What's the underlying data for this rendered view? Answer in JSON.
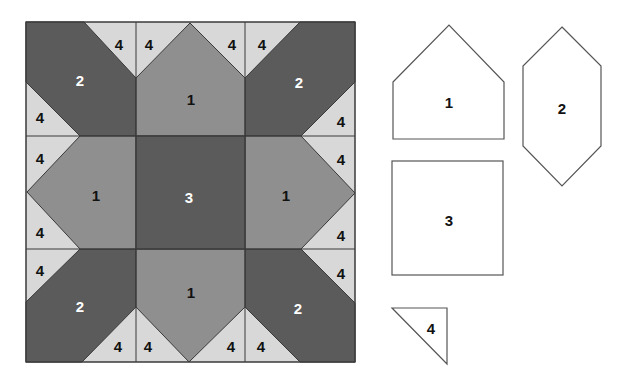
{
  "diagram": {
    "type": "quilt-block-pattern",
    "colors": {
      "light": "#d8d8d8",
      "medium": "#8f8f8f",
      "dark": "#5b5b5b",
      "outline": "#3a3a3a",
      "template_fill": "#ffffff",
      "template_stroke": "#555555"
    },
    "block": {
      "pieces": {
        "center": {
          "label": "3",
          "shade": "dark"
        },
        "sides": [
          {
            "position": "top",
            "label": "1",
            "shade": "medium"
          },
          {
            "position": "left",
            "label": "1",
            "shade": "medium"
          },
          {
            "position": "right",
            "label": "1",
            "shade": "medium"
          },
          {
            "position": "bottom",
            "label": "1",
            "shade": "medium"
          }
        ],
        "corners": [
          {
            "position": "top-left",
            "label": "2",
            "shade": "dark"
          },
          {
            "position": "top-right",
            "label": "2",
            "shade": "dark"
          },
          {
            "position": "bottom-left",
            "label": "2",
            "shade": "dark"
          },
          {
            "position": "bottom-right",
            "label": "2",
            "shade": "dark"
          }
        ],
        "triangle_label": "4",
        "triangle_count": 16
      }
    },
    "templates": [
      {
        "id": "piece-1",
        "label": "1",
        "shape": "pentagon"
      },
      {
        "id": "piece-2",
        "label": "2",
        "shape": "elongated-hexagon"
      },
      {
        "id": "piece-3",
        "label": "3",
        "shape": "square"
      },
      {
        "id": "piece-4",
        "label": "4",
        "shape": "right-triangle"
      }
    ]
  }
}
